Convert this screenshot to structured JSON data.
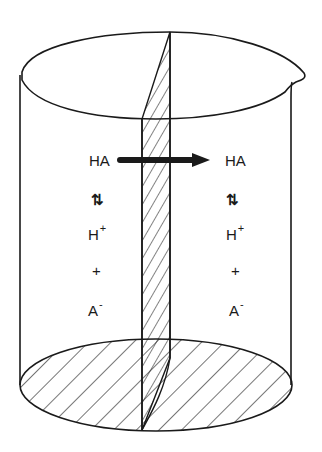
{
  "diagram": {
    "title": "",
    "colors": {
      "line": "#1a1a1a",
      "background": "#ffffff"
    },
    "left_compartment": {
      "species_top": "HA",
      "equilibrium_symbol": "⇅",
      "ion1_base": "H",
      "ion1_charge": "+",
      "plus": "+",
      "ion2_base": "A",
      "ion2_charge": "-"
    },
    "right_compartment": {
      "species_top": "HA",
      "equilibrium_symbol": "⇅",
      "ion1_base": "H",
      "ion1_charge": "+",
      "plus": "+",
      "ion2_base": "A",
      "ion2_charge": "-"
    },
    "arrow": {
      "direction": "left-to-right",
      "meaning": "HA crosses membrane"
    },
    "components": [
      "beaker",
      "membrane",
      "hatched-bottom"
    ]
  }
}
